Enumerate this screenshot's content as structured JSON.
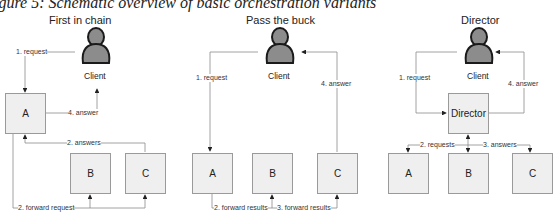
{
  "caption": "igure 5: Schematic overview of basic orchestration variants",
  "panels": [
    {
      "title": "First in chain",
      "client_label": "Client",
      "boxes": [
        "A",
        "B",
        "C"
      ],
      "edges": {
        "request": "1. request",
        "forward": "2. forward request",
        "answers": "2. answers",
        "answer": "4. answer"
      }
    },
    {
      "title": "Pass the buck",
      "client_label": "Client",
      "boxes": [
        "A",
        "B",
        "C"
      ],
      "edges": {
        "request": "1. request",
        "forward1": "2. forward results",
        "forward2": "3. forward results",
        "answer": "4. answer"
      }
    },
    {
      "title": "Director",
      "client_label": "Client",
      "director_label": "Director",
      "boxes": [
        "A",
        "B",
        "C"
      ],
      "edges": {
        "request": "1. request",
        "requests": "2. requests",
        "answers": "3. answers",
        "answer": "4. answer"
      }
    }
  ],
  "colors": {
    "box_fill": "#efefef",
    "box_border": "#9a9a9a",
    "line": "#8a8a8a",
    "client_fill": "#8c8c8c",
    "client_outline": "#1a1a1a"
  }
}
